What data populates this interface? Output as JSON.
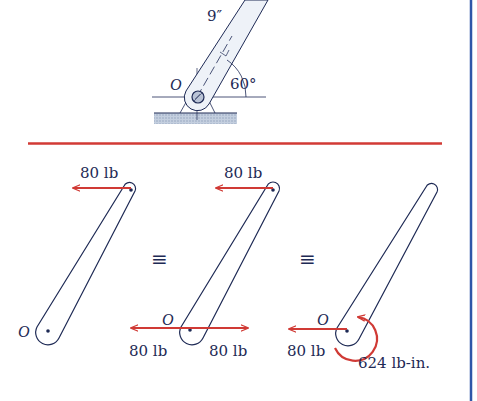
{
  "colors": {
    "ink": "#1e2a55",
    "force_red": "#d03a35",
    "separator_red": "#d23a35",
    "border_blue": "#2f56a8",
    "ground_hatch": "#a9b7cc",
    "bar_fill": "#eef2f8"
  },
  "top_figure": {
    "length_label": "9″",
    "pivot_label": "O",
    "angle_label": "60°"
  },
  "panel_1": {
    "force_label": "80 lb",
    "pivot_label": "O"
  },
  "equiv_1": "≡",
  "panel_2": {
    "top_force_label": "80 lb",
    "pivot_label": "O",
    "left_force_label": "80 lb",
    "right_force_label": "80 lb"
  },
  "equiv_2": "≡",
  "panel_3": {
    "pivot_label": "O",
    "force_label": "80 lb",
    "couple_label": "624 lb-in."
  }
}
